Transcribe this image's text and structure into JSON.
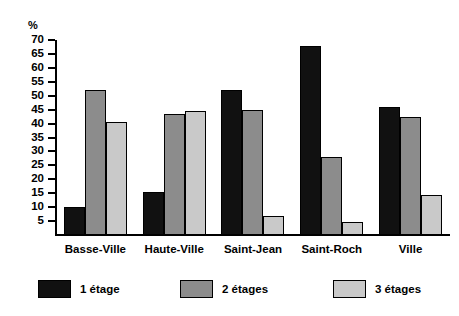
{
  "chart_data": {
    "type": "bar",
    "title": "",
    "subtitle": "",
    "xlabel": "",
    "ylabel": "%",
    "ylim": [
      0,
      70
    ],
    "ytick_step": 5,
    "yticks": [
      70,
      65,
      60,
      55,
      50,
      45,
      40,
      35,
      30,
      25,
      20,
      15,
      10,
      5
    ],
    "grid": false,
    "legend_position": "bottom",
    "categories": [
      "Basse-Ville",
      "Haute-Ville",
      "Saint-Jean",
      "Saint-Roch",
      "Ville"
    ],
    "series": [
      {
        "name": "1 étage",
        "color": "#111111",
        "values": [
          10,
          15.5,
          52,
          68,
          46
        ]
      },
      {
        "name": "2 étages",
        "color": "#8c8c8c",
        "values": [
          52,
          43.5,
          45,
          28,
          42.5
        ]
      },
      {
        "name": "3 étages",
        "color": "#c9c9c9",
        "values": [
          40.5,
          44.5,
          7,
          4.5,
          14.5
        ]
      }
    ]
  },
  "axis": {
    "unit_label": "%"
  },
  "legend": {
    "items": [
      {
        "label": "1 étage"
      },
      {
        "label": "2 étages"
      },
      {
        "label": "3 étages"
      }
    ]
  }
}
